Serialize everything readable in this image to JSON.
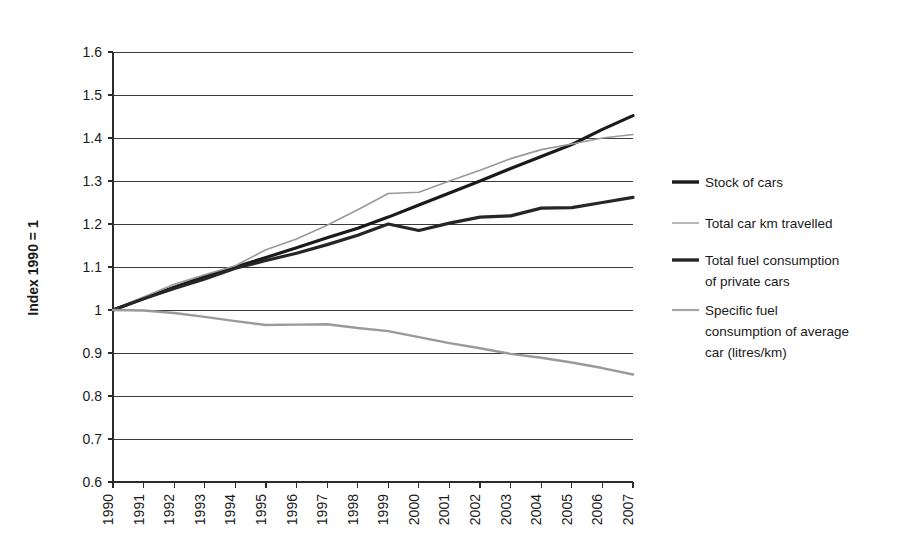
{
  "chart_data": {
    "type": "line",
    "title": "",
    "xlabel": "",
    "ylabel": "Index 1990 = 1",
    "xlim": [
      1990,
      2007
    ],
    "ylim": [
      0.6,
      1.6
    ],
    "grid": true,
    "legend_position": "right",
    "x": [
      1990,
      1991,
      1992,
      1993,
      1994,
      1995,
      1996,
      1997,
      1998,
      1999,
      2000,
      2001,
      2002,
      2003,
      2004,
      2005,
      2006,
      2007
    ],
    "xticklabels": [
      "1990",
      "1991",
      "1992",
      "1993",
      "1994",
      "1995",
      "1996",
      "1997",
      "1998",
      "1999",
      "2000",
      "2001",
      "2002",
      "2003",
      "2004",
      "2005",
      "2006",
      "2007"
    ],
    "yticklabels": [
      "0.6",
      "0.7",
      "0.8",
      "0.9",
      "1",
      "1.1",
      "1.2",
      "1.3",
      "1.4",
      "1.5",
      "1.6"
    ],
    "yticks": [
      0.6,
      0.7,
      0.8,
      0.9,
      1.0,
      1.1,
      1.2,
      1.3,
      1.4,
      1.5,
      1.6
    ],
    "series": [
      {
        "name": "Stock of cars",
        "color": "#1a1a1a",
        "width": 3.2,
        "values": [
          1.0,
          1.027,
          1.053,
          1.077,
          1.1,
          1.122,
          1.145,
          1.168,
          1.19,
          1.216,
          1.244,
          1.272,
          1.3,
          1.329,
          1.357,
          1.385,
          1.42,
          1.452
        ]
      },
      {
        "name": "Total car km travelled",
        "color": "#9a9a9a",
        "width": 1.6,
        "values": [
          1.0,
          1.03,
          1.06,
          1.082,
          1.103,
          1.14,
          1.165,
          1.197,
          1.233,
          1.271,
          1.274,
          1.3,
          1.325,
          1.352,
          1.373,
          1.386,
          1.4,
          1.408
        ]
      },
      {
        "name": "Total fuel consumption of private cars",
        "color": "#262626",
        "width": 3.2,
        "values": [
          1.0,
          1.026,
          1.05,
          1.072,
          1.097,
          1.115,
          1.132,
          1.152,
          1.174,
          1.2,
          1.185,
          1.202,
          1.216,
          1.219,
          1.237,
          1.238,
          1.25,
          1.262
        ]
      },
      {
        "name": "Specific fuel consumption of average car (litres/km)",
        "color": "#9a9a9a",
        "width": 2.4,
        "values": [
          1.0,
          0.999,
          0.993,
          0.984,
          0.974,
          0.965,
          0.966,
          0.967,
          0.958,
          0.951,
          0.937,
          0.923,
          0.911,
          0.898,
          0.889,
          0.878,
          0.865,
          0.85
        ]
      }
    ]
  },
  "legend": {
    "items": [
      {
        "label": "Stock of cars",
        "color": "#1a1a1a",
        "width": 3.4
      },
      {
        "label": "Total car km travelled",
        "color": "#a6a6a6",
        "width": 1.6
      },
      {
        "label_line1": "Total fuel consumption",
        "label_line2": "of private cars",
        "color": "#262626",
        "width": 3.4
      },
      {
        "label_line1": "Specific fuel",
        "label_line2": "consumption of average",
        "label_line3": "car (litres/km)",
        "color": "#a6a6a6",
        "width": 2.2
      }
    ]
  }
}
